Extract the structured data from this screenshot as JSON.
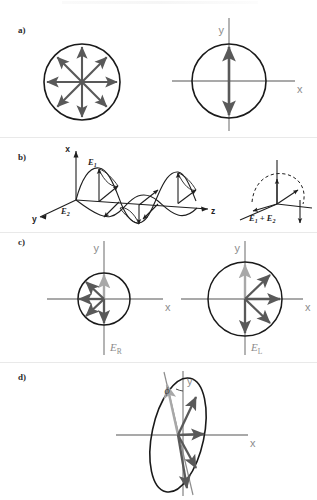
{
  "figure": {
    "background_color": "#ffffff",
    "width": 317,
    "height": 500,
    "colors": {
      "arrow_dark": "#595959",
      "arrow_light": "#a8a8a8",
      "axis_gray": "#8c8c8c",
      "circle_black": "#1a1a1a",
      "label_gray": "#8c8c8c",
      "label_dark": "#2b2b2b",
      "divider": "#e9e9e9"
    }
  },
  "panels": {
    "a": {
      "label": "a)",
      "caption": "",
      "left_diagram": {
        "name": "unpolarized-light",
        "description": "circle with eight radiating double-ended arrows",
        "arrow_count": 8,
        "circle_radius": 38
      },
      "right_diagram": {
        "name": "linearly-polarized-light",
        "description": "circle on x-y axes with a single vertical double arrow",
        "axis_labels": {
          "x": "x",
          "y": "y"
        },
        "circle_radius": 37
      }
    },
    "b": {
      "label": "b)",
      "left_diagram": {
        "name": "two-orthogonal-waves",
        "axis_labels": {
          "x": "x",
          "y": "y",
          "z": "z"
        },
        "field_labels": [
          "E",
          "E"
        ],
        "field_subscripts": [
          "1",
          "2"
        ]
      },
      "right_diagram": {
        "name": "resultant-field",
        "sum_label_base": "E",
        "sum_label_sub1": "1",
        "sum_label_plus": " + ",
        "sum_label_sub2": "2",
        "sum_label_text": "E1 + E2"
      }
    },
    "c": {
      "label": "c)",
      "left_diagram": {
        "name": "right-circular-polarization",
        "field_label_base": "E",
        "field_label_sub": "R",
        "axis_labels": {
          "x": "x",
          "y": "y"
        },
        "arrow_count": 5,
        "rotation": "counterclockwise-sweep-left",
        "circle_radius": 26
      },
      "right_diagram": {
        "name": "left-circular-polarization",
        "field_label_base": "E",
        "field_label_sub": "L",
        "axis_labels": {
          "x": "x",
          "y": "y"
        },
        "arrow_count": 5,
        "rotation": "clockwise-sweep-right",
        "circle_radius": 37
      }
    },
    "d": {
      "label": "d)",
      "diagram": {
        "name": "elliptical-polarization",
        "angle_symbol": "ϕ",
        "axis_labels": {
          "x": "x",
          "y": "y"
        },
        "ellipse_rx": 26,
        "ellipse_ry": 58,
        "tilt_degrees": 12,
        "arrow_count": 5
      }
    }
  }
}
